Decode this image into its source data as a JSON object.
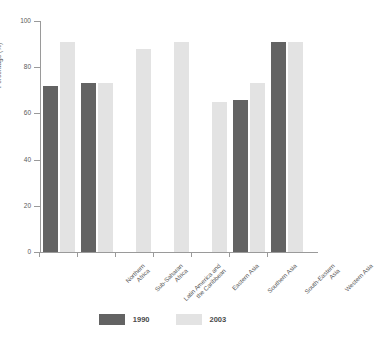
{
  "chart_data": {
    "type": "bar",
    "title": "",
    "subtitle": "",
    "xlabel": "",
    "ylabel": "Percentage (%)",
    "ylim": [
      0,
      100
    ],
    "yticks": [
      0,
      20,
      40,
      60,
      80,
      100
    ],
    "grid": false,
    "legend_position": "bottom",
    "categories": [
      "Northern\nAfrica",
      "Sub-Saharan\nAfrica",
      "Latin America and\nthe Caribbean",
      "Eastern Asia",
      "Southern Asia",
      "South-Eastern\nAsia",
      "Western Asia"
    ],
    "series": [
      {
        "name": "1990",
        "color": "#636363",
        "values": [
          72,
          73,
          null,
          null,
          null,
          66,
          91
        ]
      },
      {
        "name": "2003",
        "color": "#e3e3e3",
        "values": [
          91,
          73,
          88,
          91,
          65,
          73,
          91
        ]
      }
    ]
  },
  "axis": {
    "y_tick_labels": [
      "0",
      "20",
      "40",
      "60",
      "80",
      "100"
    ],
    "y_title": "Percentage (%)"
  },
  "legend": {
    "entries": [
      {
        "label": "1990",
        "color": "#636363"
      },
      {
        "label": "2003",
        "color": "#e3e3e3"
      }
    ]
  },
  "colors": {
    "series_1990": "#636363",
    "series_2003": "#e3e3e3",
    "axis": "#9a9a9a",
    "text": "#5a5a5a",
    "background": "#ffffff"
  }
}
